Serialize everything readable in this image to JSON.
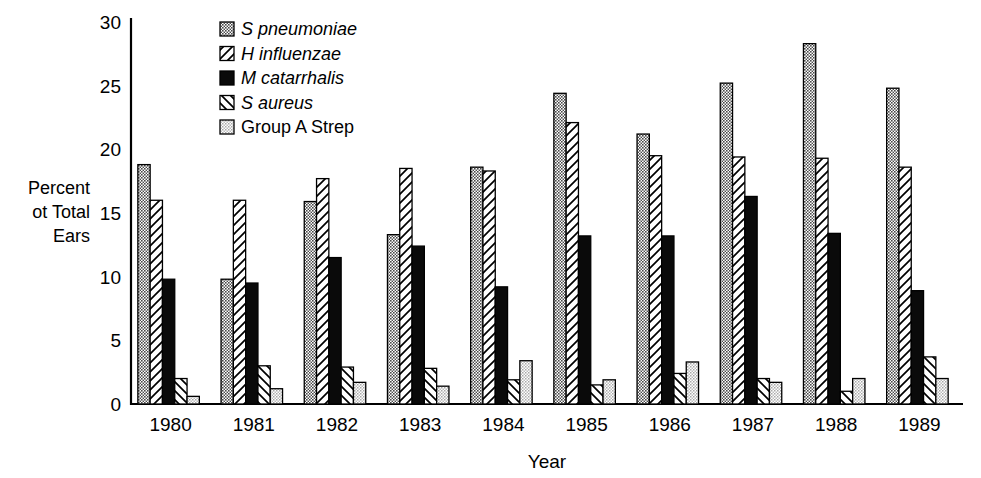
{
  "chart_data": {
    "type": "bar",
    "title": "",
    "xlabel": "Year",
    "ylabel": "Percent ot Total Ears",
    "ylabel_lines": [
      "Percent",
      "ot Total",
      "Ears"
    ],
    "ylim": [
      0,
      30
    ],
    "yticks": [
      0,
      5,
      10,
      15,
      20,
      25,
      30
    ],
    "ytick_labels": [
      "0",
      "5",
      "10",
      "15",
      "20",
      "25",
      "30"
    ],
    "grid": false,
    "legend_position": "top-center-left",
    "categories": [
      "1980",
      "1981",
      "1982",
      "1983",
      "1984",
      "1985",
      "1986",
      "1987",
      "1988",
      "1989"
    ],
    "series": [
      {
        "name": "S pneumoniae",
        "italic": true,
        "pattern": "dark-stipple",
        "color": "#6e6e6e",
        "values": [
          18.8,
          9.8,
          15.9,
          13.3,
          18.6,
          24.4,
          21.2,
          25.2,
          28.3,
          24.8
        ]
      },
      {
        "name": "H influenzae",
        "italic": true,
        "pattern": "forward-hatch",
        "color": "#ffffff",
        "values": [
          16.0,
          16.0,
          17.7,
          18.5,
          18.3,
          22.1,
          19.5,
          19.4,
          19.3,
          18.6
        ]
      },
      {
        "name": "M catarrhalis",
        "italic": true,
        "pattern": "solid-black",
        "color": "#000000",
        "values": [
          9.8,
          9.5,
          11.5,
          12.4,
          9.2,
          13.2,
          13.2,
          16.3,
          13.4,
          8.9
        ]
      },
      {
        "name": "S aureus",
        "italic": true,
        "pattern": "back-hatch",
        "color": "#ffffff",
        "values": [
          2.0,
          3.0,
          2.9,
          2.8,
          1.9,
          1.5,
          2.4,
          2.0,
          1.0,
          3.7
        ]
      },
      {
        "name": "Group A Strep",
        "italic": false,
        "pattern": "light-stipple",
        "color": "#c4c4c4",
        "values": [
          0.6,
          1.2,
          1.7,
          1.4,
          3.4,
          1.9,
          3.3,
          1.7,
          2.0,
          2.0
        ]
      }
    ]
  }
}
